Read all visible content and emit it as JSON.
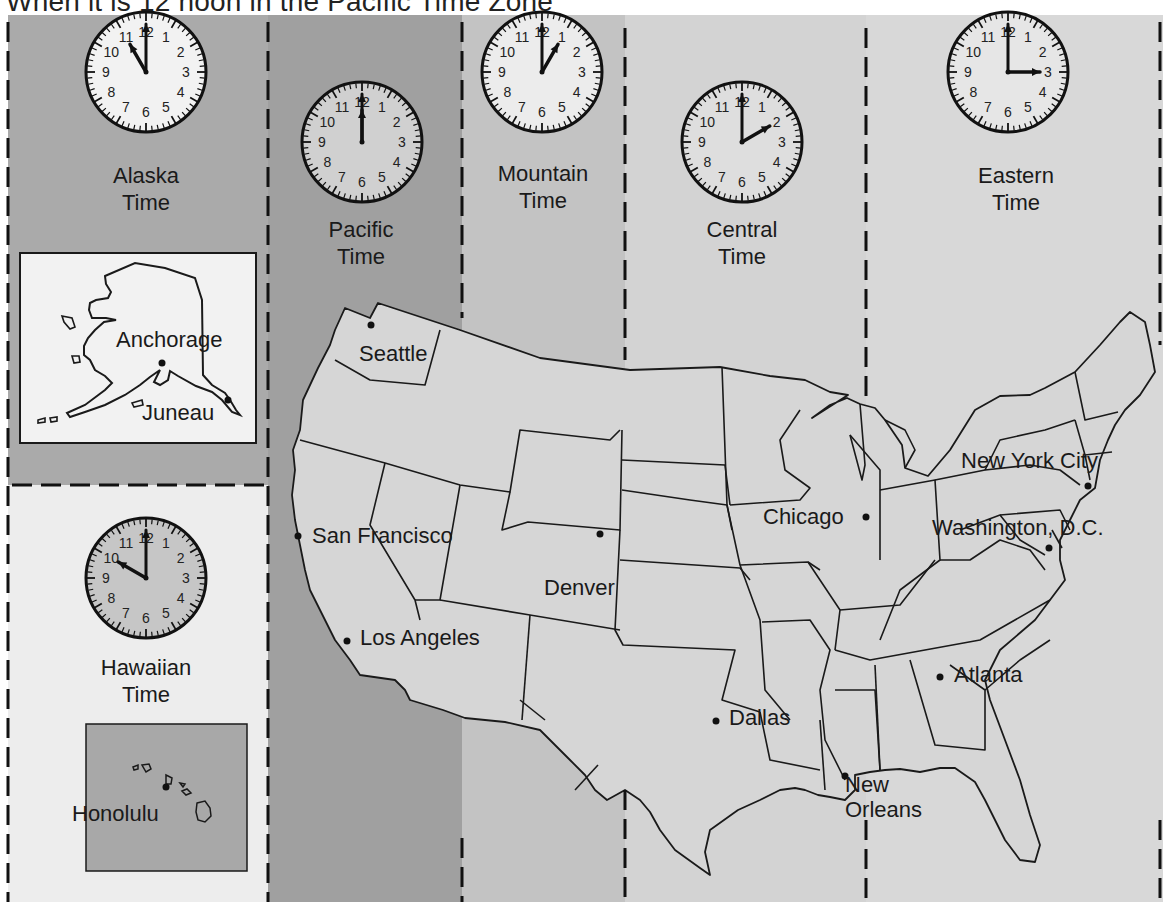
{
  "headline": "When it is 12 noon in the Pacific Time Zone",
  "colors": {
    "alaska_band": "#aaaaaa",
    "hawaii_band": "#ededed",
    "pacific_band": "#a0a0a0",
    "mountain_band": "#c3c3c3",
    "central_band": "#d3d3d3",
    "eastern_band": "#d8d8d8",
    "hawaii_inset": "#a8a8a8",
    "alaska_inset": "#f2f2f2",
    "land": "#d6d6d6",
    "outline": "#1a1a1a"
  },
  "zones": [
    {
      "id": "alaska",
      "name_line1": "Alaska",
      "name_line2": "Time",
      "clock_hour": 11,
      "clock_minute": 0
    },
    {
      "id": "pacific",
      "name_line1": "Pacific",
      "name_line2": "Time",
      "clock_hour": 12,
      "clock_minute": 0
    },
    {
      "id": "mountain",
      "name_line1": "Mountain",
      "name_line2": "Time",
      "clock_hour": 1,
      "clock_minute": 0
    },
    {
      "id": "central",
      "name_line1": "Central",
      "name_line2": "Time",
      "clock_hour": 2,
      "clock_minute": 0
    },
    {
      "id": "eastern",
      "name_line1": "Eastern",
      "name_line2": "Time",
      "clock_hour": 3,
      "clock_minute": 0
    },
    {
      "id": "hawaii",
      "name_line1": "Hawaiian",
      "name_line2": "Time",
      "clock_hour": 10,
      "clock_minute": 0
    }
  ],
  "cities": {
    "anchorage": "Anchorage",
    "juneau": "Juneau",
    "honolulu": "Honolulu",
    "seattle": "Seattle",
    "san_francisco": "San Francisco",
    "los_angeles": "Los Angeles",
    "denver": "Denver",
    "dallas": "Dallas",
    "chicago": "Chicago",
    "new_york": "New York City",
    "washington": "Washington, D.C.",
    "atlanta": "Atlanta",
    "new_orleans": "New\nOrleans"
  },
  "clock_numerals": [
    "12",
    "1",
    "2",
    "3",
    "4",
    "5",
    "6",
    "7",
    "8",
    "9",
    "10",
    "11"
  ]
}
